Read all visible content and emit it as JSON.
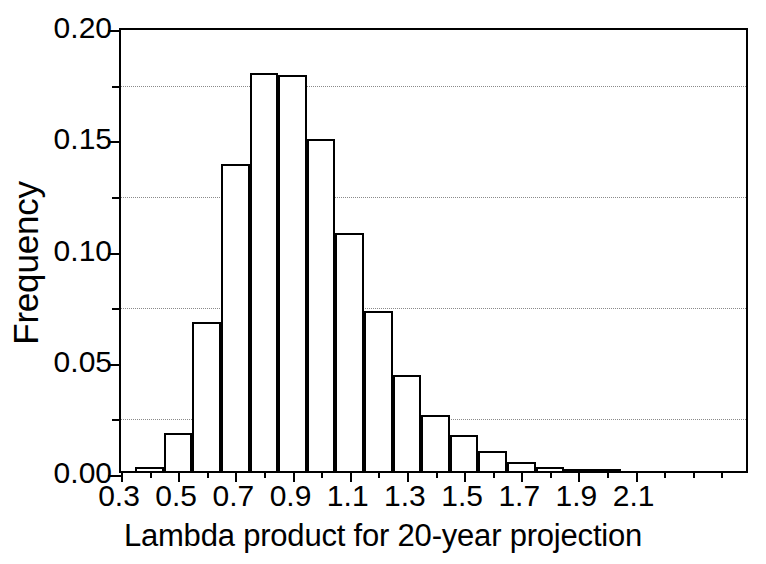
{
  "chart_data": {
    "type": "bar",
    "title": "",
    "subtitle": "",
    "xlabel": "Lambda product for 20-year projection",
    "ylabel": "Frequency",
    "xlim": [
      0.3,
      2.5
    ],
    "ylim": [
      0.0,
      0.2
    ],
    "grid": true,
    "grid_axis": "y",
    "grid_style": "dotted",
    "legend": null,
    "legend_position": "none",
    "bar_style": {
      "fill": "#ffffff",
      "edge": "#000000",
      "edge_width_px": 2.2
    },
    "bin_width": 0.1,
    "x_tick_labels": [
      "0.3",
      "0.5",
      "0.7",
      "0.9",
      "1.1",
      "1.3",
      "1.5",
      "1.7",
      "1.9",
      "2.1"
    ],
    "x_tick_values": [
      0.3,
      0.5,
      0.7,
      0.9,
      1.1,
      1.3,
      1.5,
      1.7,
      1.9,
      2.1
    ],
    "x_minor_tick_values": [
      0.4,
      0.6,
      0.8,
      1.0,
      1.2,
      1.4,
      1.6,
      1.8,
      2.0,
      2.2,
      2.3,
      2.4
    ],
    "y_tick_labels": [
      "0.00",
      "0.05",
      "0.10",
      "0.15",
      "0.20"
    ],
    "y_tick_values": [
      0.0,
      0.05,
      0.1,
      0.15,
      0.2
    ],
    "y_minor_tick_values": [
      0.025,
      0.075,
      0.125,
      0.175
    ],
    "gridline_values": [
      0.025,
      0.075,
      0.125,
      0.175
    ],
    "bin_left_edges": [
      0.35,
      0.45,
      0.55,
      0.65,
      0.75,
      0.85,
      0.95,
      1.05,
      1.15,
      1.25,
      1.35,
      1.45,
      1.55,
      1.65,
      1.75,
      1.85,
      1.95
    ],
    "bin_centers": [
      0.4,
      0.5,
      0.6,
      0.7,
      0.8,
      0.9,
      1.0,
      1.1,
      1.2,
      1.3,
      1.4,
      1.5,
      1.6,
      1.7,
      1.8,
      1.9,
      2.0
    ],
    "categories": [
      "0.35-0.45",
      "0.45-0.55",
      "0.55-0.65",
      "0.65-0.75",
      "0.75-0.85",
      "0.85-0.95",
      "0.95-1.05",
      "1.05-1.15",
      "1.15-1.25",
      "1.25-1.35",
      "1.35-1.45",
      "1.45-1.55",
      "1.55-1.65",
      "1.65-1.75",
      "1.75-1.85",
      "1.85-1.95",
      "1.95-2.05"
    ],
    "values": [
      0.002,
      0.017,
      0.067,
      0.138,
      0.179,
      0.178,
      0.149,
      0.107,
      0.072,
      0.043,
      0.025,
      0.016,
      0.009,
      0.004,
      0.002,
      0.001,
      0.0005
    ]
  }
}
